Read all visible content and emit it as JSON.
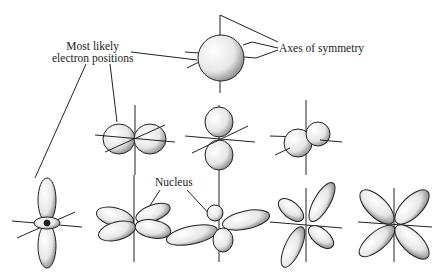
{
  "diagram": {
    "labels": {
      "electron_positions_line1": "Most likely",
      "electron_positions_line2": "electron positions",
      "axes": "Axes of symmetry",
      "nucleus": "Nucleus"
    },
    "orbitals": [
      {
        "id": "s",
        "shape": "sphere",
        "row": 0
      },
      {
        "id": "px",
        "shape": "dumbbell-horizontal",
        "row": 1
      },
      {
        "id": "py",
        "shape": "dumbbell-vertical",
        "row": 1
      },
      {
        "id": "pz",
        "shape": "dumbbell-depth",
        "row": 1
      },
      {
        "id": "dz2",
        "shape": "dumbbell-with-torus",
        "row": 2
      },
      {
        "id": "dxz",
        "shape": "four-lobe-tilted",
        "row": 2
      },
      {
        "id": "dyz",
        "shape": "four-lobe-flat",
        "row": 2
      },
      {
        "id": "dxy",
        "shape": "four-lobe-diagonal",
        "row": 2
      },
      {
        "id": "dx2-y2",
        "shape": "four-lobe-x",
        "row": 2
      }
    ],
    "colors": {
      "line": "#222222",
      "fill": "#f4f4f4",
      "shade": "#9a9a9a"
    }
  }
}
